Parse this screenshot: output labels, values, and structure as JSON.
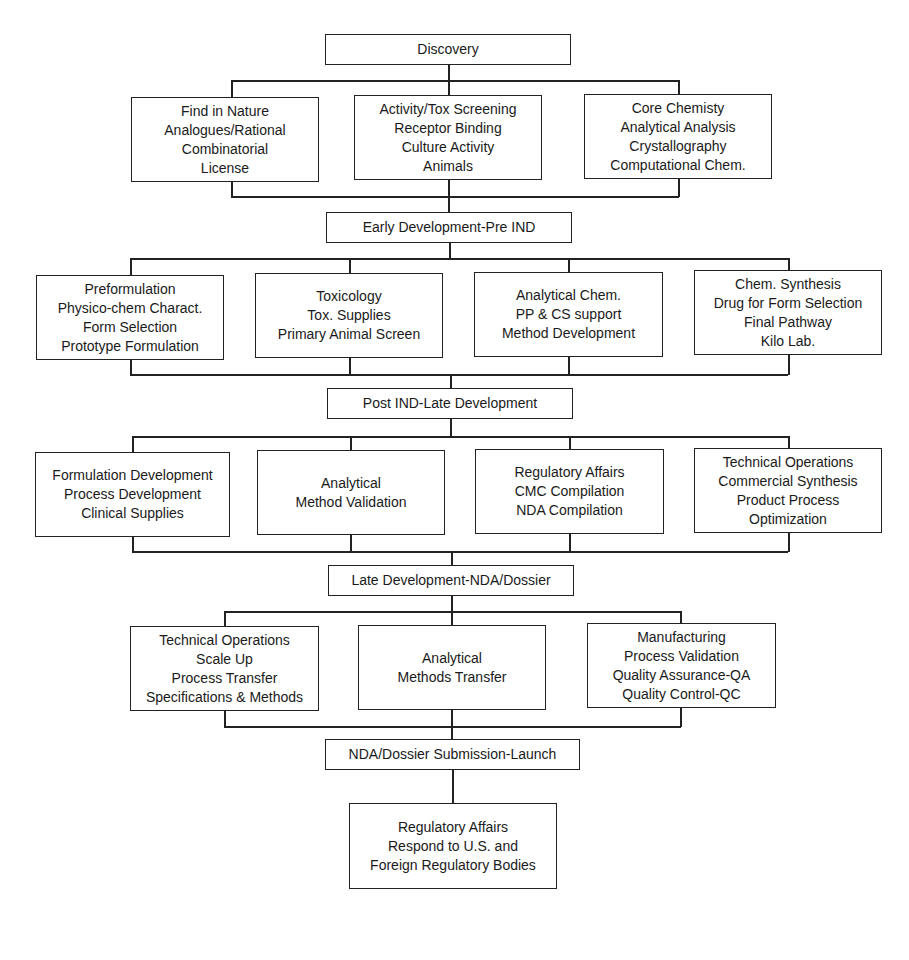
{
  "stages": {
    "discovery": "Discovery",
    "early_development": "Early Development-Pre IND",
    "post_ind": "Post IND-Late Development",
    "late_development": "Late Development-NDA/Dossier",
    "submission": "NDA/Dossier Submission-Launch"
  },
  "tier1": [
    {
      "lines": [
        "Find in Nature",
        "Analogues/Rational",
        "Combinatorial",
        "License"
      ]
    },
    {
      "lines": [
        "Activity/Tox Screening",
        "Receptor Binding",
        "Culture Activity",
        "Animals"
      ]
    },
    {
      "lines": [
        "Core Chemisty",
        "Analytical Analysis",
        "Crystallography",
        "Computational Chem."
      ]
    }
  ],
  "tier2": [
    {
      "lines": [
        "Preformulation",
        "Physico-chem Charact.",
        "Form Selection",
        "Prototype Formulation"
      ]
    },
    {
      "lines": [
        "Toxicology",
        "Tox. Supplies",
        "Primary Animal Screen"
      ]
    },
    {
      "lines": [
        "Analytical Chem.",
        "PP & CS support",
        "Method Development"
      ]
    },
    {
      "lines": [
        "Chem. Synthesis",
        "Drug for Form Selection",
        "Final Pathway",
        "Kilo Lab."
      ]
    }
  ],
  "tier3": [
    {
      "lines": [
        "Formulation Development",
        "Process Development",
        "Clinical Supplies"
      ]
    },
    {
      "lines": [
        "Analytical",
        "Method Validation"
      ]
    },
    {
      "lines": [
        "Regulatory Affairs",
        "CMC Compilation",
        "NDA Compilation"
      ]
    },
    {
      "lines": [
        "Technical Operations",
        "Commercial Synthesis",
        "Product Process",
        "Optimization"
      ]
    }
  ],
  "tier4": [
    {
      "lines": [
        "Technical Operations",
        "Scale Up",
        "Process Transfer",
        "Specifications & Methods"
      ]
    },
    {
      "lines": [
        "Analytical",
        "Methods Transfer"
      ]
    },
    {
      "lines": [
        "Manufacturing",
        "Process Validation",
        "Quality Assurance-QA",
        "Quality Control-QC"
      ]
    }
  ],
  "final": {
    "lines": [
      "Regulatory Affairs",
      "Respond to U.S. and",
      "Foreign Regulatory Bodies"
    ]
  }
}
